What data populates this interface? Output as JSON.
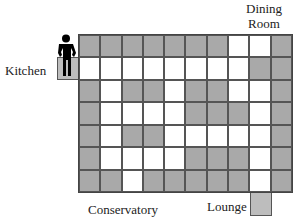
{
  "labels": {
    "kitchen": "Kitchen",
    "dining_line1": "Dining",
    "dining_line2": "Room",
    "conservatory": "Conservatory",
    "lounge": "Lounge"
  },
  "colors": {
    "shaded": "#a9a9a9",
    "open": "#ffffff",
    "room_cell": "#bdbdbd",
    "person": "#000000"
  },
  "grid": {
    "columns": 10,
    "rows": 7,
    "legend": "G = shaded square, W = white square",
    "cells": [
      "GGGGGGGWWG",
      "WWWWWWWWGG",
      "GWGGWGGWWG",
      "GWWWWGGGWG",
      "GWGGWWWWWG",
      "GWWWWGGGWG",
      "GGWGGGGGWG"
    ]
  },
  "kitchen_entry": {
    "position": "left of row 2, column 0",
    "occupied_by": "person-figure"
  },
  "lounge_entry": {
    "position": "below row 7, column 9"
  }
}
